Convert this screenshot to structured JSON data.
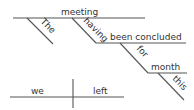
{
  "diagram": {
    "type": "sentence-diagram",
    "absolute_phrase": {
      "subject": "meeting",
      "subject_modifier": "The",
      "participle_auxiliary": "having",
      "participle": "been concluded",
      "preposition": "for",
      "prepositional_object": "month",
      "object_modifier": "this"
    },
    "main_clause": {
      "subject": "we",
      "predicate": "left"
    }
  },
  "colors": {
    "line": "#555555",
    "text": "#333333",
    "background": "#ffffff"
  }
}
